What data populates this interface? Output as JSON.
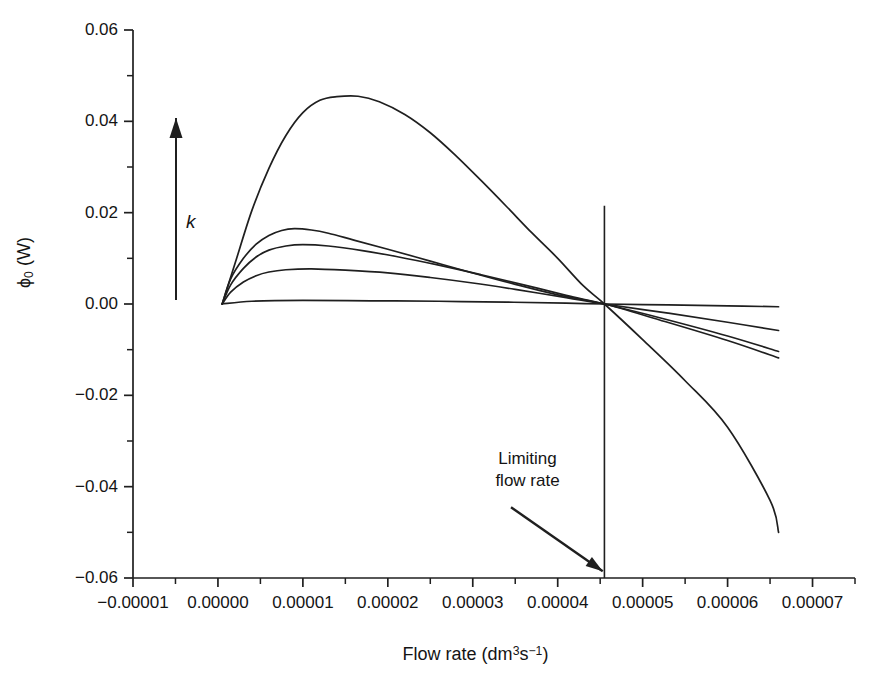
{
  "chart_data": {
    "type": "line",
    "title": "",
    "xlabel": "Flow rate (dm3s-1)",
    "xlabel_parts": {
      "text": "Flow rate (dm",
      "sup1": "3",
      "mid": "s",
      "sup2": "−1",
      "tail": ")"
    },
    "ylabel": "ϕ0 (W)",
    "ylabel_parts": {
      "symbol": "ϕ",
      "sub": "0",
      "unit": " (W)"
    },
    "xlim": [
      -1e-05,
      7.5e-05
    ],
    "ylim": [
      -0.06,
      0.06
    ],
    "xticks": [
      -1e-05,
      0.0,
      1e-05,
      2e-05,
      3e-05,
      4e-05,
      5e-05,
      6e-05,
      7e-05
    ],
    "xtick_labels": [
      "-0.00001",
      "0.00000",
      "0.00001",
      "0.00002",
      "0.00003",
      "0.00004",
      "0.00005",
      "0.00006",
      "0.00007"
    ],
    "yticks": [
      -0.06,
      -0.04,
      -0.02,
      0.0,
      0.02,
      0.04,
      0.06
    ],
    "ytick_labels": [
      "-0.06",
      "-0.04",
      "-0.02",
      "0.00",
      "0.02",
      "0.04",
      "0.06"
    ],
    "minor_yticks": [
      -0.05,
      -0.03,
      -0.01,
      0.01,
      0.03,
      0.05
    ],
    "grid": false,
    "legend": null,
    "axis_style": "left-and-bottom-spines-with-outward-ticks",
    "convergence_point": {
      "x": 4.55e-05,
      "y": 0.0
    },
    "limiting_flow_rate": 4.55e-05,
    "series": [
      {
        "name": "k1",
        "comment": "highest k, peak 0.0455 near x=1.65e-5, crosses zero at limiting flow rate, ends -0.050",
        "points": [
          [
            5e-07,
            0.0
          ],
          [
            2e-06,
            0.0088
          ],
          [
            4e-06,
            0.0205
          ],
          [
            6e-06,
            0.0297
          ],
          [
            8e-06,
            0.0369
          ],
          [
            1e-05,
            0.0419
          ],
          [
            1.2e-05,
            0.0446
          ],
          [
            1.4e-05,
            0.0454
          ],
          [
            1.65e-05,
            0.0455
          ],
          [
            1.9e-05,
            0.0443
          ],
          [
            2.2e-05,
            0.0415
          ],
          [
            2.5e-05,
            0.0375
          ],
          [
            2.8e-05,
            0.0325
          ],
          [
            3.1e-05,
            0.027
          ],
          [
            3.4e-05,
            0.0213
          ],
          [
            3.7e-05,
            0.0155
          ],
          [
            4e-05,
            0.01
          ],
          [
            4.3e-05,
            0.004
          ],
          [
            4.55e-05,
            0.0
          ],
          [
            5e-05,
            -0.0078
          ],
          [
            5.5e-05,
            -0.0168
          ],
          [
            6e-05,
            -0.027
          ],
          [
            6.5e-05,
            -0.043
          ],
          [
            6.6e-05,
            -0.05
          ]
        ]
      },
      {
        "name": "k2",
        "comment": "peak ~0.0165 near x=9e-6",
        "points": [
          [
            5e-07,
            0.0
          ],
          [
            1.5e-06,
            0.0055
          ],
          [
            3e-06,
            0.01
          ],
          [
            4.5e-06,
            0.0131
          ],
          [
            6e-06,
            0.015
          ],
          [
            7.5e-06,
            0.0161
          ],
          [
            9e-06,
            0.0165
          ],
          [
            1.1e-05,
            0.0162
          ],
          [
            1.3e-05,
            0.0155
          ],
          [
            1.6e-05,
            0.014
          ],
          [
            2e-05,
            0.012
          ],
          [
            2.5e-05,
            0.0094
          ],
          [
            3e-05,
            0.0068
          ],
          [
            3.5e-05,
            0.0043
          ],
          [
            4e-05,
            0.002
          ],
          [
            4.55e-05,
            0.0
          ],
          [
            5.2e-05,
            -0.0035
          ],
          [
            6e-05,
            -0.008
          ],
          [
            6.6e-05,
            -0.0118
          ]
        ]
      },
      {
        "name": "k3",
        "comment": "peak ~0.0130 near x=1.0e-5",
        "points": [
          [
            5e-07,
            0.0
          ],
          [
            1.5e-06,
            0.0042
          ],
          [
            3e-06,
            0.0078
          ],
          [
            4.5e-06,
            0.0103
          ],
          [
            6e-06,
            0.0118
          ],
          [
            8e-06,
            0.0127
          ],
          [
            1e-05,
            0.013
          ],
          [
            1.3e-05,
            0.0127
          ],
          [
            1.7e-05,
            0.0117
          ],
          [
            2.1e-05,
            0.0104
          ],
          [
            2.6e-05,
            0.0085
          ],
          [
            3.1e-05,
            0.0064
          ],
          [
            3.6e-05,
            0.0042
          ],
          [
            4.1e-05,
            0.0019
          ],
          [
            4.55e-05,
            0.0
          ],
          [
            5.2e-05,
            -0.003
          ],
          [
            6e-05,
            -0.007
          ],
          [
            6.6e-05,
            -0.0104
          ]
        ]
      },
      {
        "name": "k4",
        "comment": "peak ~0.0077 near x=1.1e-5",
        "points": [
          [
            5e-07,
            0.0
          ],
          [
            1.5e-06,
            0.0026
          ],
          [
            3e-06,
            0.0048
          ],
          [
            4.5e-06,
            0.0062
          ],
          [
            6e-06,
            0.007
          ],
          [
            8e-06,
            0.0075
          ],
          [
            1.1e-05,
            0.0077
          ],
          [
            1.5e-05,
            0.0074
          ],
          [
            2e-05,
            0.0068
          ],
          [
            2.5e-05,
            0.0058
          ],
          [
            3e-05,
            0.0046
          ],
          [
            3.5e-05,
            0.0032
          ],
          [
            4.1e-05,
            0.0014
          ],
          [
            4.55e-05,
            0.0
          ],
          [
            5.3e-05,
            -0.002
          ],
          [
            6e-05,
            -0.004
          ],
          [
            6.6e-05,
            -0.0058
          ]
        ]
      },
      {
        "name": "k5",
        "comment": "lowest k, nearly flat, slight positive bump then zero",
        "points": [
          [
            5e-07,
            0.0
          ],
          [
            4e-06,
            0.0006
          ],
          [
            1e-05,
            0.0008
          ],
          [
            1.8e-05,
            0.0007
          ],
          [
            2.6e-05,
            0.0006
          ],
          [
            3.4e-05,
            0.0004
          ],
          [
            4.1e-05,
            0.0002
          ],
          [
            4.55e-05,
            0.0
          ],
          [
            5.3e-05,
            -0.0002
          ],
          [
            6e-05,
            -0.0004
          ],
          [
            6.6e-05,
            -0.0006
          ]
        ]
      }
    ],
    "annotations": [
      {
        "name": "limiting-flow-rate",
        "text_line1": "Limiting",
        "text_line2": "flow rate",
        "arrow_from": {
          "x": 3.45e-05,
          "y": -0.0445
        },
        "arrow_to": {
          "x": 4.53e-05,
          "y": -0.0585
        }
      },
      {
        "name": "k-direction",
        "text": "k",
        "arrow_direction": "up",
        "meaning": "increasing k"
      }
    ],
    "vertical_marker": {
      "name": "limiting-flow-rate-line",
      "x": 4.55e-05,
      "y_from": -0.06,
      "y_to": 0.0215
    },
    "colors": {
      "line": "#1f1f1f",
      "axis": "#1f1f1f",
      "background": "#ffffff",
      "text": "#141414"
    }
  }
}
